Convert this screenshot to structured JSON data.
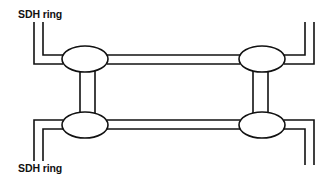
{
  "diagram": {
    "labels": {
      "top_ring": "SDH ring",
      "bottom_ring": "SDH ring"
    },
    "nodes": [
      {
        "id": "node-top-left",
        "cx": 85,
        "cy": 59,
        "rx": 23,
        "ry": 13
      },
      {
        "id": "node-top-right",
        "cx": 262,
        "cy": 59,
        "rx": 23,
        "ry": 13
      },
      {
        "id": "node-bottom-left",
        "cx": 85,
        "cy": 125,
        "rx": 23,
        "ry": 13
      },
      {
        "id": "node-bottom-right",
        "cx": 262,
        "cy": 125,
        "rx": 23,
        "ry": 13
      }
    ],
    "links": [
      {
        "id": "link-top-horizontal",
        "from": "node-top-left",
        "to": "node-top-right"
      },
      {
        "id": "link-bottom-horizontal",
        "from": "node-bottom-left",
        "to": "node-bottom-right"
      },
      {
        "id": "link-left-vertical",
        "from": "node-top-left",
        "to": "node-bottom-left"
      },
      {
        "id": "link-right-vertical",
        "from": "node-top-right",
        "to": "node-bottom-right"
      },
      {
        "id": "link-top-left-ring-stub",
        "from": "node-top-left",
        "to": "top-ring"
      },
      {
        "id": "link-top-right-ring-stub",
        "from": "node-top-right",
        "to": "top-ring"
      },
      {
        "id": "link-bottom-left-ring-stub",
        "from": "node-bottom-left",
        "to": "bottom-ring"
      },
      {
        "id": "link-bottom-right-ring-stub",
        "from": "node-bottom-right",
        "to": "bottom-ring"
      }
    ],
    "colors": {
      "stroke": "#111111",
      "background": "#ffffff"
    }
  }
}
